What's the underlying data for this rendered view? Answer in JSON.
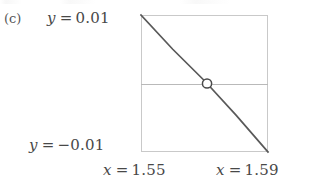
{
  "figure": {
    "panel_letter": "(c)",
    "labels": {
      "y_top": {
        "var": "y",
        "eq": "=",
        "value": "0.01"
      },
      "y_bottom": {
        "var": "y",
        "eq": "=",
        "value": "−0.01"
      },
      "x_left": {
        "var": "x",
        "eq": "=",
        "value": "1.55"
      },
      "x_right": {
        "var": "x",
        "eq": "=",
        "value": "1.59"
      }
    },
    "colors": {
      "curve": "#595959",
      "frame": "#c9c9c9",
      "zero_axis": "#b9b9b9",
      "marker_stroke": "#4a4a4a",
      "marker_fill": "#ffffff",
      "text": "#484848",
      "background": "#ffffff"
    }
  },
  "chart_data": {
    "type": "line",
    "title": "(c)",
    "xlabel": "",
    "ylabel": "",
    "xlim": [
      1.55,
      1.59
    ],
    "ylim": [
      -0.01,
      0.01
    ],
    "xticks": [
      1.55,
      1.59
    ],
    "xticklabels": [
      "x = 1.55",
      "x = 1.59"
    ],
    "yticks": [
      -0.01,
      0.01
    ],
    "yticklabels": [
      "y = -0.01",
      "y = 0.01"
    ],
    "grid": false,
    "legend": null,
    "series": [
      {
        "name": "f(x)",
        "x": [
          1.55,
          1.56,
          1.57,
          1.5708,
          1.58,
          1.59
        ],
        "y": [
          0.01,
          0.005,
          0.0004,
          0.0,
          -0.00465,
          -0.01
        ]
      }
    ],
    "reference_lines": [
      {
        "name": "y-zero-axis",
        "orientation": "horizontal",
        "value": 0.0
      }
    ],
    "markers": [
      {
        "name": "root",
        "x": 1.5708,
        "y": 0.0,
        "style": "open-circle"
      }
    ],
    "annotations": [
      {
        "text": "(c)",
        "position": "outside-left-top"
      },
      {
        "text": "y = 0.01",
        "position": "axis-left-top"
      },
      {
        "text": "y = -0.01",
        "position": "axis-left-bottom"
      },
      {
        "text": "x = 1.55",
        "position": "axis-bottom-left"
      },
      {
        "text": "x = 1.59",
        "position": "axis-bottom-right"
      }
    ]
  }
}
